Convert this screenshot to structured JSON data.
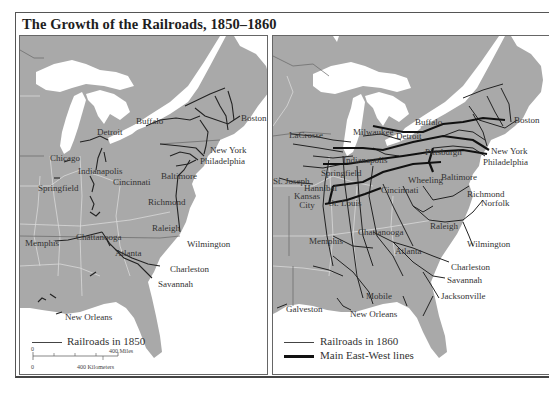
{
  "title": "The Growth of the Railroads, 1850–1860",
  "colors": {
    "land": "#a8a8a8",
    "water": "#ffffff",
    "railroad": "#222222",
    "border": "#d8d8d8",
    "text": "#333333"
  },
  "maps": [
    {
      "id": "map-1850",
      "year": "1850",
      "cities": [
        {
          "name": "Detroit",
          "x": 77,
          "y": 92
        },
        {
          "name": "Buffalo",
          "x": 116,
          "y": 81
        },
        {
          "name": "Boston",
          "x": 221,
          "y": 78
        },
        {
          "name": "New York",
          "x": 190,
          "y": 113
        },
        {
          "name": "Philadelphia",
          "x": 180,
          "y": 124
        },
        {
          "name": "Chicago",
          "x": 30,
          "y": 120
        },
        {
          "name": "Indianapolis",
          "x": 58,
          "y": 131
        },
        {
          "name": "Cincinnati",
          "x": 93,
          "y": 142
        },
        {
          "name": "Springfield",
          "x": 18,
          "y": 148
        },
        {
          "name": "Baltimore",
          "x": 141,
          "y": 138
        },
        {
          "name": "Richmond",
          "x": 128,
          "y": 162
        },
        {
          "name": "Raleigh",
          "x": 132,
          "y": 188
        },
        {
          "name": "Chattanooga",
          "x": 56,
          "y": 197
        },
        {
          "name": "Memphis",
          "x": 5,
          "y": 203
        },
        {
          "name": "Wilmington",
          "x": 167,
          "y": 204
        },
        {
          "name": "Atlanta",
          "x": 95,
          "y": 213
        },
        {
          "name": "Charleston",
          "x": 150,
          "y": 229
        },
        {
          "name": "Savannah",
          "x": 138,
          "y": 244
        },
        {
          "name": "New Orleans",
          "x": 45,
          "y": 277
        }
      ],
      "legend": [
        {
          "label": "Railroads in 1850",
          "style": "thin"
        }
      ],
      "scale": {
        "miles_label": "400 Miles",
        "km_label": "400 Kilometers",
        "zero_label": "0"
      }
    },
    {
      "id": "map-1860",
      "year": "1860",
      "cities": [
        {
          "name": "LaCrosse",
          "x": 16,
          "y": 97
        },
        {
          "name": "Milwaukee",
          "x": 80,
          "y": 93
        },
        {
          "name": "Detroit",
          "x": 125,
          "y": 97
        },
        {
          "name": "Buffalo",
          "x": 142,
          "y": 82
        },
        {
          "name": "Boston",
          "x": 241,
          "y": 80
        },
        {
          "name": "New York",
          "x": 218,
          "y": 111
        },
        {
          "name": "Philadelphia",
          "x": 210,
          "y": 122
        },
        {
          "name": "Pittsburgh",
          "x": 152,
          "y": 113
        },
        {
          "name": "Indianapolis",
          "x": 70,
          "y": 120
        },
        {
          "name": "Springfield",
          "x": 48,
          "y": 133
        },
        {
          "name": "St. Joseph",
          "x": 0,
          "y": 141
        },
        {
          "name": "Hannibal",
          "x": 31,
          "y": 148
        },
        {
          "name": "Wheeling",
          "x": 135,
          "y": 140
        },
        {
          "name": "Baltimore",
          "x": 168,
          "y": 137
        },
        {
          "name": "Cincinnati",
          "x": 108,
          "y": 150
        },
        {
          "name": "Kansas City",
          "x": 20,
          "y": 158
        },
        {
          "name": "St. Louis",
          "x": 56,
          "y": 163
        },
        {
          "name": "Richmond",
          "x": 194,
          "y": 154
        },
        {
          "name": "Norfolk",
          "x": 208,
          "y": 163
        },
        {
          "name": "Raleigh",
          "x": 157,
          "y": 186
        },
        {
          "name": "Chattanooga",
          "x": 85,
          "y": 192
        },
        {
          "name": "Memphis",
          "x": 36,
          "y": 201
        },
        {
          "name": "Wilmington",
          "x": 194,
          "y": 204
        },
        {
          "name": "Atlanta",
          "x": 122,
          "y": 211
        },
        {
          "name": "Charleston",
          "x": 178,
          "y": 227
        },
        {
          "name": "Savannah",
          "x": 174,
          "y": 240
        },
        {
          "name": "Mobile",
          "x": 93,
          "y": 256
        },
        {
          "name": "Jacksonville",
          "x": 168,
          "y": 256
        },
        {
          "name": "Galveston",
          "x": 13,
          "y": 269
        },
        {
          "name": "New Orleans",
          "x": 77,
          "y": 274
        }
      ],
      "legend": [
        {
          "label": "Railroads in 1860",
          "style": "thin"
        },
        {
          "label": "Main East-West lines",
          "style": "thick"
        }
      ]
    }
  ]
}
